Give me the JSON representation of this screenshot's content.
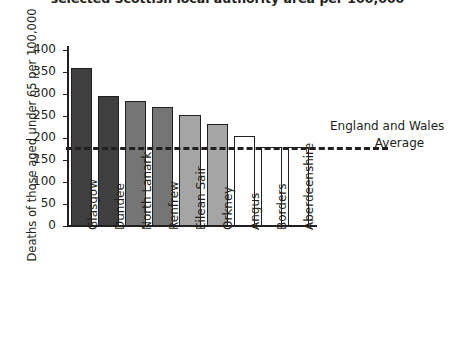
{
  "chart_data": {
    "type": "bar",
    "title": "selected Scottish local authority area per 100,000",
    "xlabel": "",
    "ylabel": "Deaths of those aged under 65 per 100,000",
    "ylim": [
      0,
      400
    ],
    "ytick_labels": [
      "400",
      "350",
      "300",
      "250",
      "200",
      "150",
      "100",
      "50",
      "0"
    ],
    "yticks": [
      400,
      350,
      300,
      250,
      200,
      150,
      100,
      50,
      0
    ],
    "grid": false,
    "legend_position": "right-inline-annotation",
    "categories": [
      "Glasgow",
      "Dundee",
      "North Lanark",
      "Renfrew",
      "Eilean Sair",
      "Orkney",
      "Angus",
      "Borders",
      "Aberdeenshire"
    ],
    "values": [
      358,
      296,
      285,
      271,
      253,
      232,
      205,
      180,
      180
    ],
    "bar_colors": [
      "#3f3f3f",
      "#3f3f3f",
      "#757575",
      "#757575",
      "#a5a5a5",
      "#a5a5a5",
      "#ffffff",
      "#ffffff",
      "#ffffff"
    ],
    "reference_line": {
      "value": 180,
      "style": "dashed",
      "color": "#231f20",
      "label_line_1": "England and Wales",
      "label_line_2": "Average"
    }
  }
}
